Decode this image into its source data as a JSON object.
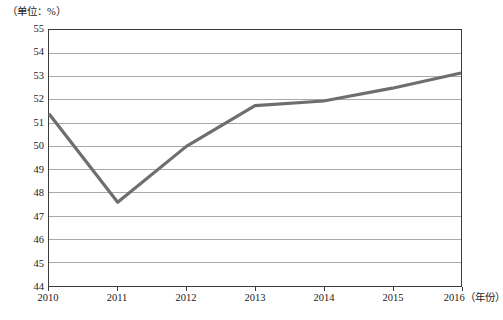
{
  "chart_data": {
    "type": "line",
    "title": "",
    "subtitle": "",
    "unit_label": "（单位：%）",
    "xlabel": "（年份）",
    "ylabel": "",
    "categories": [
      "2010",
      "2011",
      "2012",
      "2013",
      "2014",
      "2015",
      "2016"
    ],
    "x": [
      2010,
      2011,
      2012,
      2013,
      2014,
      2015,
      2016
    ],
    "values": [
      51.4,
      47.6,
      50.0,
      51.75,
      51.95,
      52.5,
      53.15
    ],
    "series": [
      {
        "name": "",
        "values": [
          51.4,
          47.6,
          50.0,
          51.75,
          51.95,
          52.5,
          53.15
        ]
      }
    ],
    "ylim": [
      44,
      55
    ],
    "ytick_labels": [
      "55",
      "54",
      "53",
      "52",
      "51",
      "50",
      "49",
      "48",
      "47",
      "46",
      "45",
      "44"
    ],
    "yticks": [
      55,
      54,
      53,
      52,
      51,
      50,
      49,
      48,
      47,
      46,
      45,
      44
    ],
    "xlim": [
      2010,
      2016
    ],
    "grid": true,
    "grid_axis": "y",
    "legend": false,
    "legend_position": "none",
    "line_color": "#6e6e6e",
    "grid_color": "#a8a8a8",
    "frame_color": "#3b3b3b",
    "markers": false,
    "annotations": []
  }
}
